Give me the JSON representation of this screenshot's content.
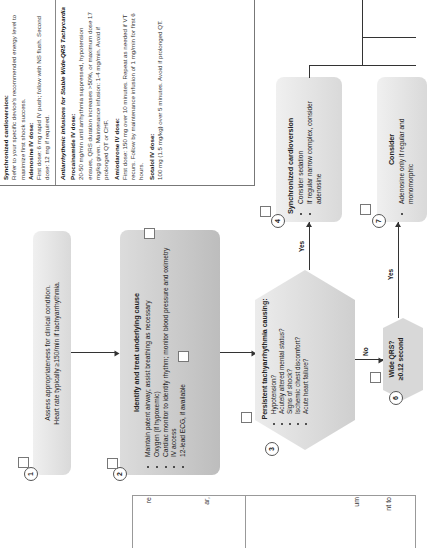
{
  "nodes": {
    "n1": {
      "number": "1",
      "lines": [
        "Assess appropriateness for clinical condition.",
        "Heart rate typically ≥150/min if tachyarrhythmia."
      ]
    },
    "n2": {
      "number": "2",
      "title": "Identify and treat underlying cause",
      "bullets": [
        "Maintain patent airway; assist breathing as necessary",
        "Oxygen (if hypoxemic)",
        "Cardiac monitor to identify rhythm; monitor blood pressure and oximetry",
        "IV access",
        "12-lead ECG, if available"
      ]
    },
    "n3": {
      "number": "3",
      "title": "Persistent tachyarrhythmia causing:",
      "bullets": [
        "Hypotension?",
        "Acutely altered mental status?",
        "Signs of shock?",
        "Ischemic chest discomfort?",
        "Acute heart failure?"
      ]
    },
    "n4": {
      "number": "4",
      "title": "Synchronized cardioversion",
      "bullets": [
        "Consider sedation",
        "If regular narrow complex, consider adenosine"
      ]
    },
    "n6": {
      "number": "6",
      "title": "Wide QRS?",
      "subtitle": "≥0.12 second"
    },
    "n7": {
      "number": "7",
      "title": "Consider",
      "bullets": [
        "Adenosine only if regular and monomorphic"
      ]
    }
  },
  "edge_labels": {
    "yes1": "Yes",
    "no": "No",
    "yes2": "Yes"
  },
  "dosing": {
    "s1_head": "Synchronized cardioversion:",
    "s1_text": "Refer to your specific device's recommended energy level to maximize first shock success.",
    "s2_head": "Adenosine IV dose:",
    "s2_text": "First dose: 6 mg rapid IV push; follow with NS flush. Second dose: 12 mg if required.",
    "s3_head": "Antiarrhythmic Infusions for Stable Wide-QRS Tachycardia",
    "s4_head": "Procainamide IV dose:",
    "s4_text": "20-50 mg/min until arrhythmia suppressed, hypotension ensues, QRS duration increases >50%, or maximum dose 17 mg/kg given. Maintenance infusion: 1-4 mg/min. Avoid if prolonged QT or CHF.",
    "s5_head": "Amiodarone IV dose:",
    "s5_text": "First dose: 150 mg over 10 minutes. Repeat as needed if VT recurs. Follow by maintenance infusion of 1 mg/min for first 6 hours.",
    "s6_head": "Sotalol IV dose:",
    "s6_text": "100 mg (1.5 mg/kg) over 5 minutes. Avoid if prolonged QT."
  },
  "partial_table": {
    "row1_a": "re",
    "row1_b": "ar,",
    "row2_a": "um",
    "row2_b": "nt to"
  }
}
